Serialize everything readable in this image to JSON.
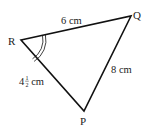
{
  "diagram": {
    "type": "triangle",
    "vertices": {
      "R": {
        "label": "R"
      },
      "Q": {
        "label": "Q"
      },
      "P": {
        "label": "P"
      }
    },
    "sides": {
      "RQ": {
        "label": "6 cm"
      },
      "QP": {
        "label": "8 cm"
      },
      "RP": {
        "label_whole": "4",
        "label_num": "1",
        "label_den": "2",
        "label_unit": " cm"
      }
    },
    "angle_marker": {
      "vertex": "R",
      "style": "double-arc"
    },
    "colors": {
      "stroke": "#111111",
      "text": "#222222",
      "background": "#ffffff"
    }
  }
}
